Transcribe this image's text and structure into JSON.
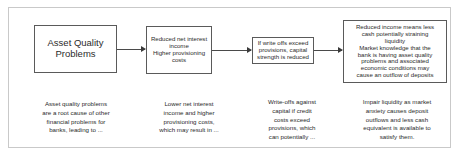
{
  "diagram": {
    "type": "flowchart",
    "orientation": "left-to-right",
    "frame_color": "#c9c9c9",
    "box_border_color": "#5a5a5a",
    "arrow_color": "#3a3a3a",
    "text_color": "#2b2b2b",
    "nodes": [
      {
        "id": "node-1",
        "label": "Asset Quality\nProblems",
        "caption": "Asset quality problems\nare a root cause of other\nfinancial problems for\nbanks, leading to ..."
      },
      {
        "id": "node-2",
        "label": "Reduced net interest\nincome\nHigher provisioning\ncosts",
        "caption": "Lower net interest\nincome and higher\nprovisioning costs,\nwhich may result in ..."
      },
      {
        "id": "node-3",
        "label": "If write offs exceed\nprovisions, capital\nstrength is reduced",
        "caption": "Write-offs against\ncapital if credit\ncosts exceed\nprovisions, which\ncan potentially ..."
      },
      {
        "id": "node-4",
        "label": "Reduced income means less\ncash potentially straining\nliquidity\nMarket knowledge that the\nbank is having asset quality\nproblems and associated\neconomic conditions may\ncause an outflow of deposits",
        "caption": "Impair liquidity as market\nanxiety causes deposit\noutflows and less cash\nequivalent is available to\nsatisfy them."
      }
    ],
    "connectors": [
      {
        "id": "connector-1-2",
        "from": "node-1",
        "to": "node-2",
        "arrowhead": "right"
      },
      {
        "id": "connector-2-3",
        "from": "node-2",
        "to": "node-3",
        "arrowhead": "right"
      },
      {
        "id": "connector-3-4",
        "from": "node-3",
        "to": "node-4",
        "arrowhead": "right"
      }
    ]
  }
}
